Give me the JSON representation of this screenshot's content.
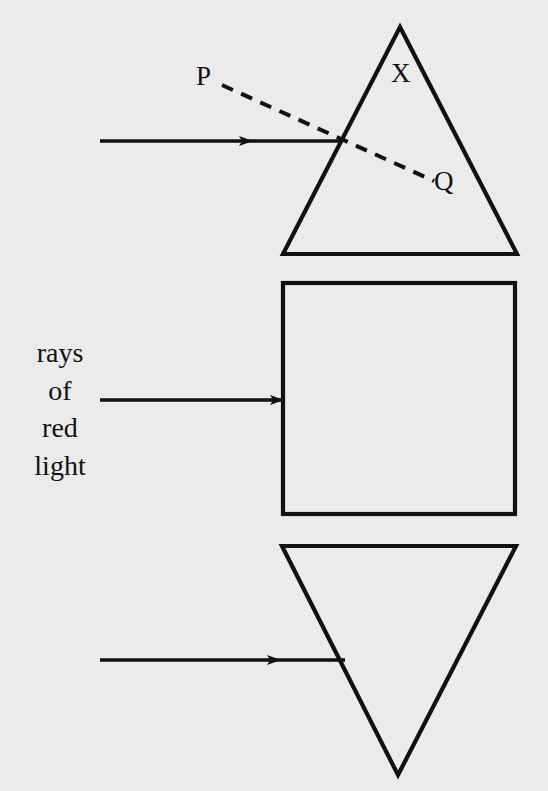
{
  "figure": {
    "background_color": "#ebebeb",
    "ink_color": "#111111",
    "width": 548,
    "height": 791
  },
  "labels": {
    "P": "P",
    "X": "X",
    "Q": "Q"
  },
  "ray_caption": {
    "lines": [
      "rays",
      "of",
      "red",
      "light"
    ],
    "full_text": "rays of red light"
  },
  "shapes": [
    {
      "name": "upright-triangle-prism",
      "type": "triangle",
      "orientation": "apex-up",
      "points": "400,27 517,254 283,254"
    },
    {
      "name": "square-block",
      "type": "rectangle",
      "x": 283,
      "y": 283,
      "width": 232,
      "height": 231
    },
    {
      "name": "inverted-triangle-prism",
      "type": "triangle",
      "orientation": "apex-down",
      "points": "282,546 516,546 398,775"
    }
  ],
  "rays": [
    {
      "name": "incident-ray-top",
      "style": "solid",
      "from": [
        100,
        141
      ],
      "to": [
        340,
        141
      ],
      "arrowhead_at": [
        250,
        141
      ]
    },
    {
      "name": "incident-ray-middle",
      "style": "solid",
      "from": [
        100,
        400
      ],
      "to": [
        283,
        400
      ],
      "arrowhead_at": [
        283,
        400
      ]
    },
    {
      "name": "incident-ray-bottom",
      "style": "solid",
      "from": [
        100,
        660
      ],
      "to": [
        345,
        660
      ],
      "arrowhead_at": [
        278,
        660
      ]
    },
    {
      "name": "dashed-construction-line-PQ",
      "style": "dashed",
      "from": [
        222,
        85
      ],
      "to": [
        434,
        181
      ]
    }
  ]
}
